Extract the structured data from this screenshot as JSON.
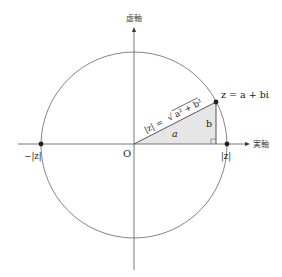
{
  "diagram": {
    "axes": {
      "imaginary_label": "虚軸",
      "real_label": "実軸",
      "origin_label": "O"
    },
    "point": {
      "label": "z = a + bi"
    },
    "triangle": {
      "hypotenuse_label": "|z| = √(a² + b²)",
      "hyp_prefix": "|z| = ",
      "hyp_radicand": "a² + b²",
      "base_label": "a",
      "height_label": "b"
    },
    "circle_points": {
      "positive_label": "|z|",
      "negative_label": "−|z|"
    },
    "colors": {
      "line": "#555555",
      "fill": "#e6e6e6",
      "point": "#222222"
    }
  }
}
